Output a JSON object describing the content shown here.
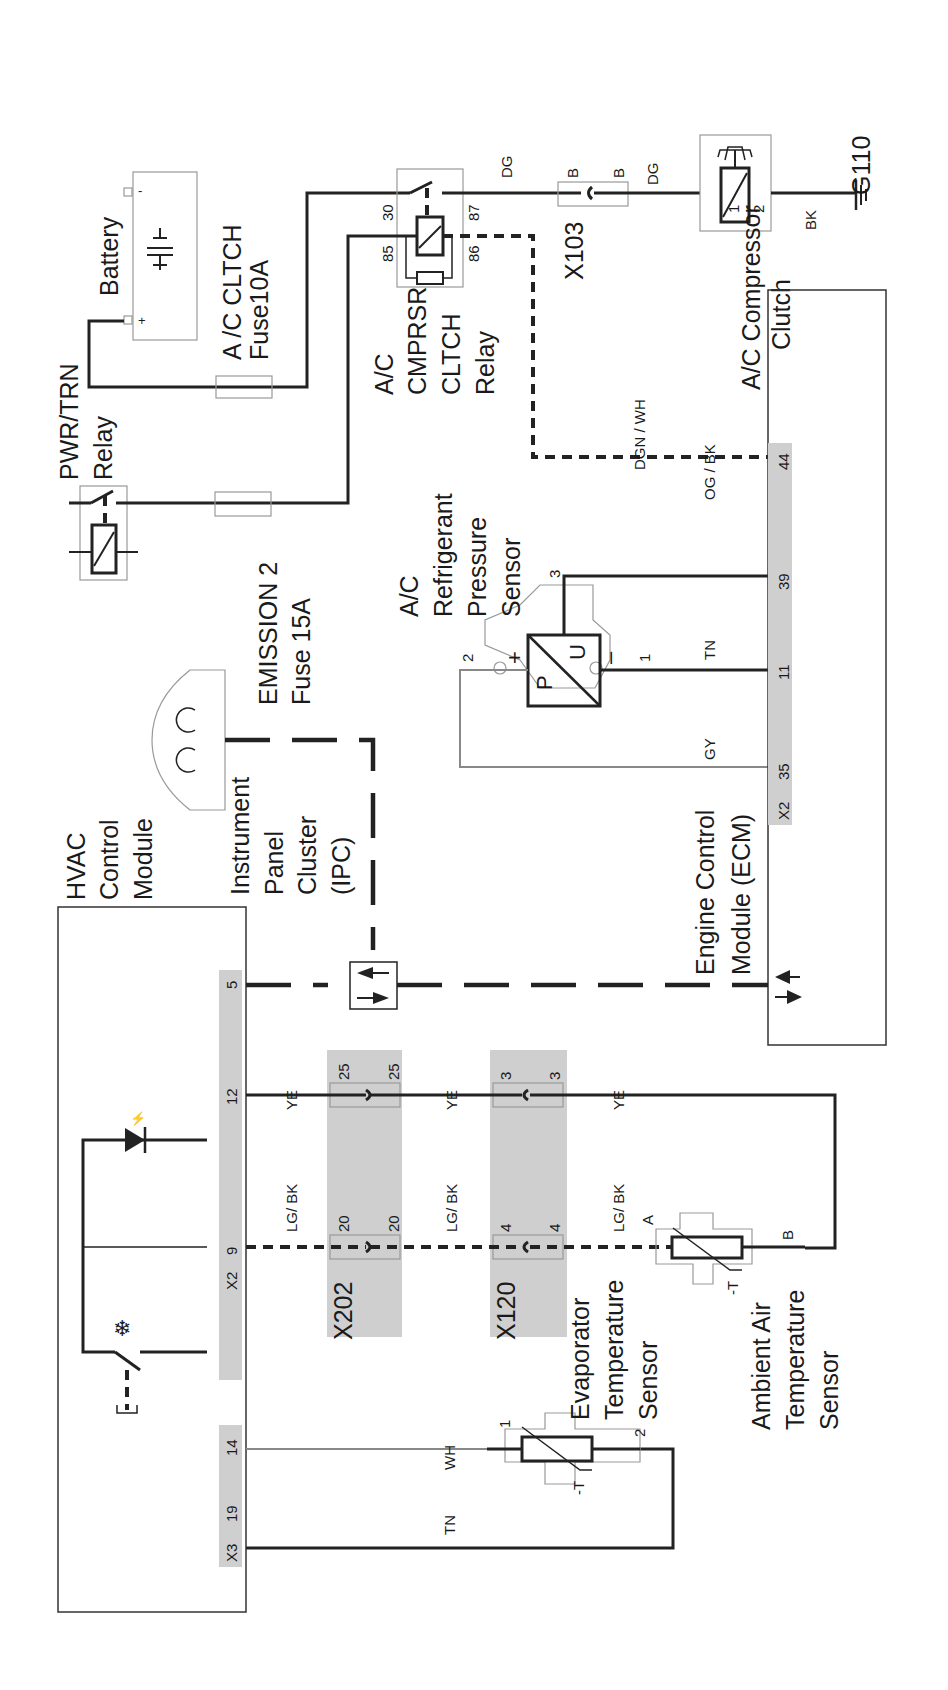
{
  "diagram": {
    "orientation": "rotated 90 degrees clockwise",
    "components": {
      "battery": {
        "label": "Battery",
        "pos_terminal": "+",
        "neg_terminal": "-"
      },
      "ac_cltch_fuse": {
        "line1": "A /C CLTCH",
        "line2": "Fuse10A"
      },
      "pwr_trn_relay": {
        "line1": "PWR/TRN",
        "line2": "Relay"
      },
      "emission_fuse": {
        "line1": "EMISSION 2",
        "line2": "Fuse 15A"
      },
      "ac_relay": {
        "line1": "A/C",
        "line2": "CMPRSR",
        "line3": "CLTCH",
        "line4": "Relay",
        "pin_30": "30",
        "pin_87": "87",
        "pin_85": "85",
        "pin_86": "86"
      },
      "x103": {
        "label": "X103",
        "pin_left": "B",
        "pin_right": "B"
      },
      "compressor_clutch": {
        "line1": "A/C Compressor",
        "line2": "Clutch",
        "pin_1": "1",
        "pin_2": "2"
      },
      "ground": {
        "label": "G110"
      },
      "pressure_sensor": {
        "line1": "A/C",
        "line2": "Refrigerant",
        "line3": "Pressure",
        "line4": "Sensor",
        "pin_1": "1",
        "pin_2": "2",
        "pin_3": "3",
        "sym_p": "P",
        "sym_u": "U",
        "sym_plus": "+",
        "sym_minus": "–"
      },
      "ecm": {
        "line1": "Engine Control",
        "line2": "Module (ECM)",
        "connector": "X2",
        "pins": [
          "35",
          "11",
          "39",
          "44"
        ]
      },
      "ipc": {
        "line1": "Instrument",
        "line2": "Panel",
        "line3": "Cluster",
        "line4": "(IPC)"
      },
      "hvac": {
        "line1": "HVAC",
        "line2": "Control",
        "line3": "Module",
        "x2_connector": "X2",
        "x2_pins": [
          "9",
          "12",
          "5"
        ],
        "x3_connector": "X3",
        "x3_pins": [
          "19",
          "14"
        ]
      },
      "x202": {
        "label": "X202",
        "pins": [
          "20",
          "25"
        ]
      },
      "x120": {
        "label": "X120",
        "pins": [
          "4",
          "3"
        ]
      },
      "evap_sensor": {
        "line1": "Evaporator",
        "line2": "Temperature",
        "line3": "Sensor",
        "pin_1": "1",
        "pin_2": "2",
        "sym": "-T"
      },
      "ambient_sensor": {
        "line1": "Ambient Air",
        "line2": "Temperature",
        "line3": "Sensor",
        "pin_a": "A",
        "pin_b": "B",
        "sym": "-T"
      }
    },
    "wires": {
      "dg_1": "DG",
      "dg_2": "DG",
      "bk": "BK",
      "dgn_wh": "DGN / WH",
      "og_bk": "OG / BK",
      "tn_ecm": "TN",
      "gy": "GY",
      "ye_1": "YE",
      "ye_2": "YE",
      "ye_3": "YE",
      "lgbk_1": "LG/ BK",
      "lgbk_2": "LG/ BK",
      "lgbk_3": "LG/ BK",
      "wh": "WH",
      "tn_hvac": "TN"
    }
  }
}
